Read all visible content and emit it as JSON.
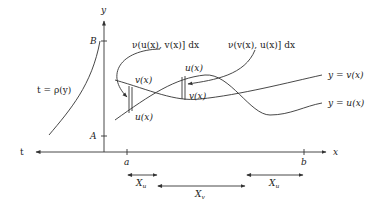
{
  "diagram": {
    "axes": {
      "y_label": "y",
      "x_label": "x",
      "t_label": "t",
      "y_ticks": {
        "top": "B",
        "bottom": "A"
      },
      "x_ticks": {
        "left": "a",
        "right": "b"
      }
    },
    "curves": {
      "rho_label": "t = ρ(y)",
      "v_label": "y = v(x)",
      "u_label": "y = u(x)"
    },
    "strip_left": {
      "top_label": "v(x)",
      "bottom_label": "u(x)",
      "callout": "ν(u(x), v(x)] dx"
    },
    "strip_right": {
      "top_label": "u(x)",
      "bottom_label": "v(x)",
      "callout": "ν(v(x), u(x)] dx"
    },
    "intervals": [
      {
        "label": "X",
        "sub": "u"
      },
      {
        "label": "X",
        "sub": "v"
      },
      {
        "label": "X",
        "sub": "u"
      }
    ]
  }
}
